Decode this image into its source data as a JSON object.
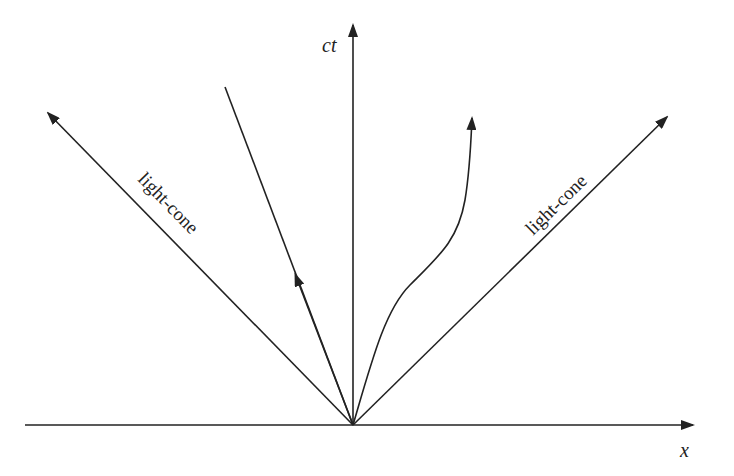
{
  "diagram": {
    "type": "spacetime-light-cone",
    "axes": {
      "vertical": {
        "label": "ct"
      },
      "horizontal": {
        "label": "x"
      }
    },
    "light_cone_labels": {
      "left": "light-cone",
      "right": "light-cone"
    },
    "worldlines": [
      {
        "name": "straight-timelike-worldline",
        "shape": "straight",
        "direction": "up-left"
      },
      {
        "name": "curved-timelike-worldline",
        "shape": "curved",
        "direction": "up-right"
      }
    ],
    "colors": {
      "ink": "#222222",
      "background": "#ffffff"
    }
  }
}
